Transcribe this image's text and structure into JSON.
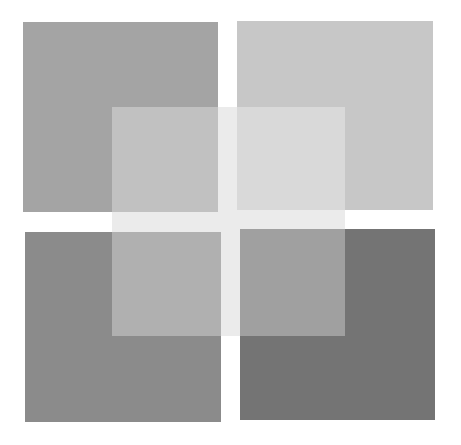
{
  "figure": {
    "background_color": "#ffffff",
    "squares": [
      {
        "name": "top-left",
        "x": 23,
        "y": 22,
        "w": 195,
        "h": 190,
        "color": "#a4a4a4"
      },
      {
        "name": "top-right",
        "x": 237,
        "y": 21,
        "w": 196,
        "h": 189,
        "color": "#c7c7c7"
      },
      {
        "name": "bottom-left",
        "x": 25,
        "y": 232,
        "w": 196,
        "h": 190,
        "color": "#8b8b8b"
      },
      {
        "name": "bottom-right",
        "x": 240,
        "y": 229,
        "w": 195,
        "h": 191,
        "color": "#747474"
      }
    ],
    "overlay": {
      "name": "center-overlay",
      "x": 112,
      "y": 107,
      "w": 233,
      "h": 229,
      "color": "#ffffff",
      "opacity": 0.32,
      "gap_color": "#e2e2e2"
    }
  }
}
